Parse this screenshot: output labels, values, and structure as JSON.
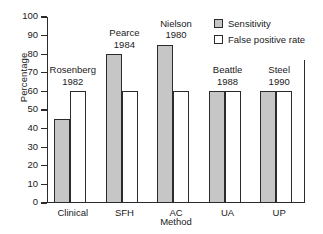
{
  "chart_data": {
    "type": "bar",
    "title": "",
    "xlabel": "Method",
    "ylabel": "Percentage",
    "ylim": [
      0,
      100
    ],
    "ytick_step": 10,
    "yticks": [
      100,
      90,
      80,
      70,
      60,
      50,
      40,
      30,
      20,
      10,
      0
    ],
    "categories": [
      "Clinical",
      "SFH",
      "AC",
      "UA",
      "UP"
    ],
    "series": [
      {
        "name": "Sensitivity",
        "fill": "#c6c6c6",
        "values": [
          45,
          80,
          85,
          60,
          60
        ]
      },
      {
        "name": "False positive rate",
        "fill": "#ffffff",
        "values": [
          60,
          60,
          60,
          60,
          60
        ]
      }
    ],
    "annotations": [
      {
        "author": "Rosenberg",
        "year": "1982"
      },
      {
        "author": "Pearce",
        "year": "1984"
      },
      {
        "author": "Nielson",
        "year": "1980"
      },
      {
        "author": "Beattle",
        "year": "1988"
      },
      {
        "author": "Steel",
        "year": "1990"
      }
    ],
    "legend_position": "top-right",
    "grid": false,
    "axis_color": "#2b2b2b"
  }
}
